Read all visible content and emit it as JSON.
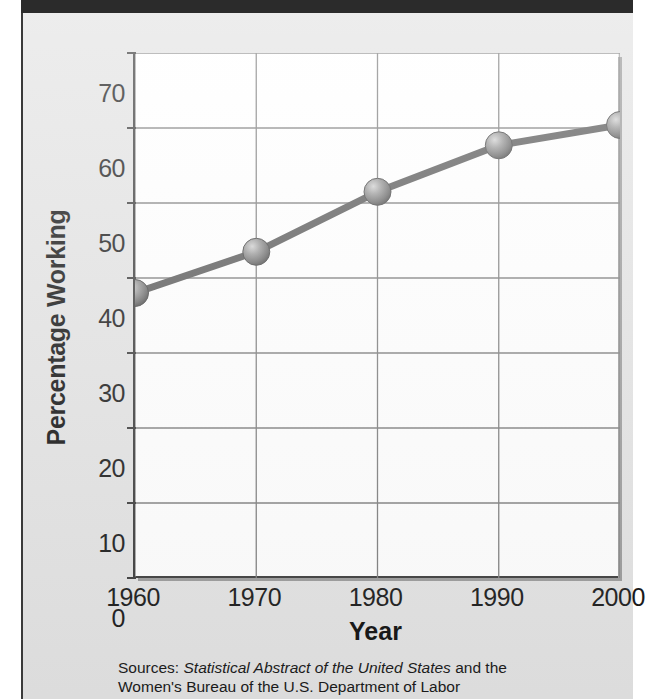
{
  "figure": {
    "background_color": "#e3e3e3",
    "plot_background_color": "#ffffff",
    "top_bar_color": "#2b2b2b",
    "marker_color": "#6e6e6e",
    "line_color": "#5a5a5a"
  },
  "chart_data": {
    "type": "line",
    "title": "",
    "xlabel": "Year",
    "ylabel": "Percentage Working",
    "x": [
      1960,
      1970,
      1980,
      1990,
      2000
    ],
    "categories": [
      "1960",
      "1970",
      "1980",
      "1990",
      "2000"
    ],
    "values": [
      38,
      43.5,
      51.5,
      57.7,
      60.4
    ],
    "series": [
      {
        "name": "Percentage Working",
        "values": [
          38,
          43.5,
          51.5,
          57.7,
          60.4
        ]
      }
    ],
    "xlim": [
      1960,
      2000
    ],
    "ylim": [
      0,
      70
    ],
    "yticks": [
      0,
      10,
      20,
      30,
      40,
      50,
      60,
      70
    ],
    "ytick_labels": [
      "0",
      "10",
      "20",
      "30",
      "40",
      "50",
      "60",
      "70"
    ],
    "xticks": [
      1960,
      1970,
      1980,
      1990,
      2000
    ],
    "xtick_labels": [
      "1960",
      "1970",
      "1980",
      "1990",
      "2000"
    ],
    "grid": true,
    "legend": false,
    "marker": "sphere"
  },
  "caption": {
    "line1_prefix": "Sources: ",
    "line1_italic": "Statistical Abstract of the United States",
    "line1_suffix": " and the",
    "line2": "Women's Bureau of the U.S. Department of Labor"
  }
}
